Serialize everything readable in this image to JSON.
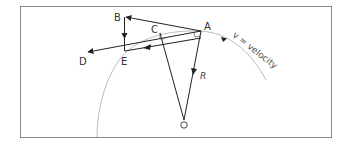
{
  "diagram": {
    "title": "",
    "points": {
      "A": "A",
      "B": "B",
      "C": "C",
      "D": "D",
      "E": "E",
      "O": "O"
    },
    "vector_labels": {
      "radius": "R",
      "velocity": "v = velocity"
    },
    "colors": {
      "line": "#222222",
      "arc": "#aaaaaa",
      "frame": "#888888",
      "text": "#333333"
    }
  }
}
